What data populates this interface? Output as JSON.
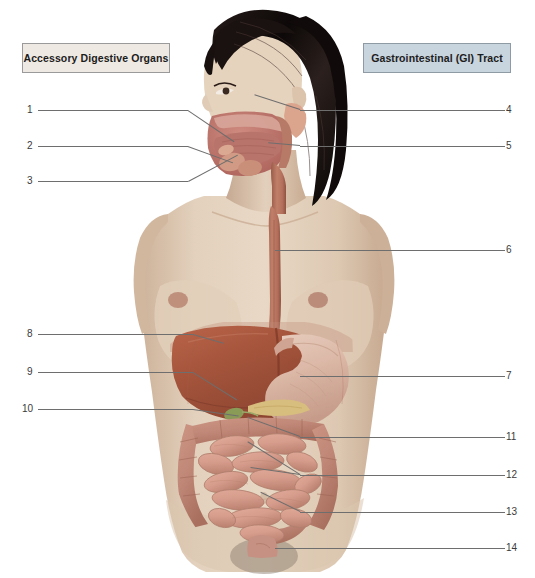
{
  "diagram": {
    "title_left": "Accessory Digestive Organs",
    "title_right": "Gastrointestinal (GI) Tract",
    "colors": {
      "legend_left_bg": "#efe9e3",
      "legend_right_bg": "#c8d4de",
      "legend_border": "#9a9a9a",
      "leader_line": "#6e6e6e",
      "number_text": "#3a3a3a",
      "skin": "#e0cdb8",
      "skin_shadow": "#c9ae95",
      "hair": "#15100f",
      "liver": "#a8563c",
      "stomach": "#dcb9a8",
      "esophagus": "#b5705c",
      "gallbladder": "#8a9a57",
      "pancreas": "#d7bd7e",
      "small_intestine": "#d79d8d",
      "large_intestine": "#c08878",
      "oral_cavity": "#c4766d",
      "tongue": "#b8736a",
      "salivary_gland": "#d09a84",
      "rectum": "#c69182"
    },
    "labels_left": [
      {
        "n": "1",
        "y": 110,
        "line_x": 38,
        "line_w": 150
      },
      {
        "n": "2",
        "y": 146,
        "line_x": 38,
        "line_w": 150
      },
      {
        "n": "3",
        "y": 181,
        "line_x": 38,
        "line_w": 150
      }
    ],
    "labels_left_lower": [
      {
        "n": "8",
        "y": 334,
        "line_x": 38,
        "line_w": 155
      },
      {
        "n": "9",
        "y": 372,
        "line_x": 38,
        "line_w": 155
      },
      {
        "n": "10",
        "y": 409,
        "line_x": 38,
        "line_w": 155
      }
    ],
    "labels_right": [
      {
        "n": "4",
        "y": 110,
        "line_x": 300,
        "line_w": 205
      },
      {
        "n": "5",
        "y": 146,
        "line_x": 300,
        "line_w": 205
      },
      {
        "n": "6",
        "y": 250,
        "line_x": 275,
        "line_w": 230
      },
      {
        "n": "7",
        "y": 376,
        "line_x": 300,
        "line_w": 205
      },
      {
        "n": "11",
        "y": 437,
        "line_x": 300,
        "line_w": 205
      },
      {
        "n": "12",
        "y": 475,
        "line_x": 300,
        "line_w": 205
      },
      {
        "n": "13",
        "y": 512,
        "line_x": 300,
        "line_w": 205
      },
      {
        "n": "14",
        "y": 548,
        "line_x": 275,
        "line_w": 230
      }
    ]
  }
}
